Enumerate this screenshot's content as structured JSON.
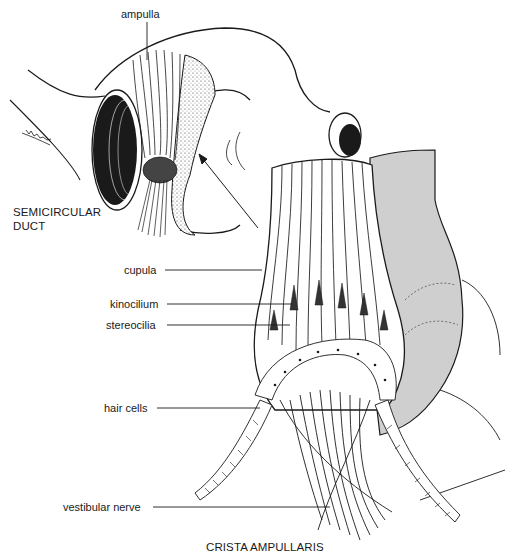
{
  "figure": {
    "titles": {
      "semicircular_duct_line1": "SEMICIRCULAR",
      "semicircular_duct_line2": "DUCT",
      "crista_ampullaris": "CRISTA AMPULLARIS"
    },
    "labels": {
      "ampulla": "ampulla",
      "cupula": "cupula",
      "kinocilium": "kinocilium",
      "stereocilia": "stereocilia",
      "hair_cells": "hair cells",
      "vestibular_nerve": "vestibular nerve"
    },
    "colors": {
      "ink": "#1a1a1a",
      "shade": "#c8c8c8",
      "background": "#ffffff"
    }
  }
}
